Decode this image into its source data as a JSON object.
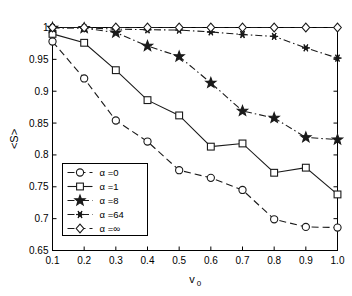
{
  "chart_data": {
    "type": "line",
    "title": "",
    "xlabel": "v_0",
    "xlabel_main": "v",
    "xlabel_sub": "0",
    "ylabel": "<S>",
    "xlim": [
      0.1,
      1.0
    ],
    "ylim": [
      0.65,
      1.0
    ],
    "grid": false,
    "legend_position": "lower-left-inside",
    "x": [
      0.1,
      0.2,
      0.3,
      0.4,
      0.5,
      0.6,
      0.7,
      0.8,
      0.9,
      1.0
    ],
    "xticks": [
      "0.1",
      "0.2",
      "0.3",
      "0.4",
      "0.5",
      "0.6",
      "0.7",
      "0.8",
      "0.9",
      "1.0"
    ],
    "yticks": [
      "0.65",
      "0.7",
      "0.75",
      "0.8",
      "0.85",
      "0.9",
      "0.95",
      "1"
    ],
    "ytick_values": [
      0.65,
      0.7,
      0.75,
      0.8,
      0.85,
      0.9,
      0.95,
      1.0
    ],
    "series": [
      {
        "name": "alpha-0",
        "legend": "α =0",
        "marker": "circle",
        "linestyle": "dashed",
        "color": "#1a1a1a",
        "values": [
          0.978,
          0.92,
          0.854,
          0.821,
          0.776,
          0.764,
          0.745,
          0.699,
          0.687,
          0.686
        ]
      },
      {
        "name": "alpha-1",
        "legend": "α =1",
        "marker": "square",
        "linestyle": "solid",
        "color": "#1a1a1a",
        "values": [
          0.99,
          0.976,
          0.933,
          0.886,
          0.862,
          0.813,
          0.818,
          0.772,
          0.78,
          0.738
        ]
      },
      {
        "name": "alpha-8",
        "legend": "α =8",
        "marker": "star",
        "linestyle": "dashdot",
        "color": "#1a1a1a",
        "values": [
          0.9995,
          0.999,
          0.992,
          0.971,
          0.9545,
          0.913,
          0.869,
          0.858,
          0.8275,
          0.824
        ]
      },
      {
        "name": "alpha-64",
        "legend": "α =64",
        "marker": "asterisk",
        "linestyle": "dashdot",
        "color": "#1a1a1a",
        "values": [
          0.9998,
          0.9995,
          0.9975,
          0.9965,
          0.996,
          0.993,
          0.989,
          0.986,
          0.968,
          0.952
        ]
      },
      {
        "name": "alpha-inf",
        "legend": "α =∞",
        "marker": "diamond",
        "linestyle": "dashed",
        "color": "#1a1a1a",
        "values": [
          1.0,
          1.0,
          1.0,
          1.0,
          1.0,
          1.0,
          1.0,
          1.0,
          1.0,
          1.0
        ]
      }
    ]
  }
}
